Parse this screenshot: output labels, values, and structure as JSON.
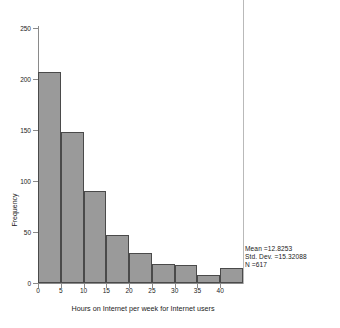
{
  "chart_data": {
    "type": "bar",
    "title": "",
    "xlabel": "Hours on Internet per week for Internet users",
    "ylabel": "Frequency",
    "categories": [
      "0-5",
      "5-10",
      "10-15",
      "15-20",
      "20-25",
      "25-30",
      "30-35",
      "35-40",
      "40-45"
    ],
    "bin_edges": [
      0,
      5,
      10,
      15,
      20,
      25,
      30,
      35,
      40,
      45
    ],
    "values": [
      207,
      148,
      90,
      47,
      29,
      19,
      18,
      8,
      15
    ],
    "xlim": [
      0,
      45
    ],
    "ylim": [
      0,
      250
    ],
    "xticks": [
      0,
      5,
      10,
      15,
      20,
      25,
      30,
      35,
      40
    ],
    "yticks": [
      0,
      50,
      100,
      150,
      200,
      250
    ],
    "grid": false,
    "legend": null,
    "bar_color": "#9a9a9a",
    "bar_edge_color": "#4a4a4a",
    "axis_color": "#8a8a8a",
    "annotations": [
      "Mean =12.8253",
      "Std. Dev. =15.32088",
      "N =617"
    ]
  },
  "stats": {
    "mean_label": "Mean =12.8253",
    "stddev_label": "Std. Dev. =15.32088",
    "n_label": "N =617"
  },
  "axes": {
    "y_title": "Frequency",
    "x_title": "Hours on Internet per week for Internet users",
    "ytick_labels": [
      "0",
      "50",
      "100",
      "150",
      "200",
      "250"
    ],
    "xtick_labels": [
      "0",
      "5",
      "10",
      "15",
      "20",
      "25",
      "30",
      "35",
      "40"
    ]
  }
}
